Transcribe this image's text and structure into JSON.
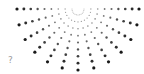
{
  "graphic": {
    "name": "radial-dot-burst",
    "center": [
      78,
      9
    ],
    "inner_radius": 6,
    "outer_radius": 61,
    "rays": 13,
    "start_angle_deg": 0,
    "end_angle_deg": 180,
    "dots_per_ray": 9,
    "min_dot_radius": 0.5,
    "max_dot_radius": 1.6,
    "color": "#1a1a1a"
  },
  "help_glyph": "?"
}
